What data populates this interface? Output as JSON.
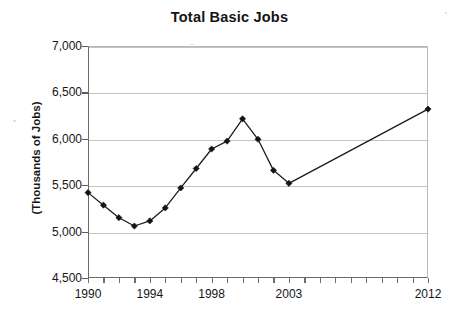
{
  "chart_data": {
    "type": "line",
    "title": "Total Basic Jobs",
    "xlabel": "",
    "ylabel": "(Thousands of Jobs)",
    "ylim": [
      4500,
      7000
    ],
    "xlim": [
      1990,
      2012
    ],
    "grid": true,
    "legend": "none",
    "y_ticks": [
      "4,500",
      "5,000",
      "5,500",
      "6,000",
      "6,500",
      "7,000"
    ],
    "y_tick_values": [
      4500,
      5000,
      5500,
      6000,
      6500,
      7000
    ],
    "x_tick_labels": [
      "1990",
      "1994",
      "1998",
      "2003",
      "2012"
    ],
    "x_tick_values": [
      1990,
      1994,
      1998,
      2003,
      2012
    ],
    "x_minor_ticks": [
      1990,
      1991,
      1992,
      1993,
      1994,
      1995,
      1996,
      1997,
      1998,
      1999,
      2000,
      2001,
      2002,
      2003,
      2004,
      2005,
      2006,
      2007,
      2008,
      2009,
      2010,
      2011,
      2012
    ],
    "series": [
      {
        "name": "Total Basic Jobs",
        "marker": "diamond",
        "color": "#131313",
        "x": [
          1990,
          1991,
          1992,
          1993,
          1994,
          1995,
          1996,
          1997,
          1998,
          1999,
          2000,
          2001,
          2002,
          2003,
          2012
        ],
        "values": [
          5420,
          5285,
          5150,
          5060,
          5115,
          5255,
          5470,
          5680,
          5890,
          5975,
          6215,
          5995,
          5660,
          5520,
          6320
        ]
      }
    ]
  },
  "colors": {
    "series": "#131313",
    "grid": "#c3c3c3",
    "axis": "#6a6a6a",
    "text": "#141414",
    "background": "#ffffff"
  }
}
